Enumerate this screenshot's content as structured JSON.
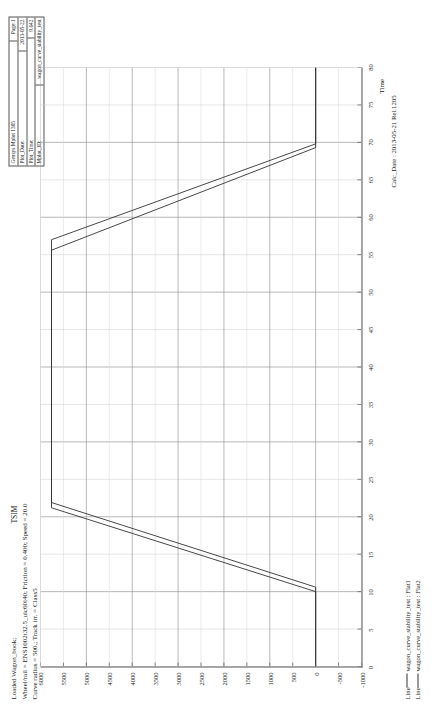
{
  "info_box": {
    "app_title": "Gensys Mplot 1305",
    "page_label": "Page:1",
    "plot_date_label": "Plot_Date:",
    "plot_date_value": "2013-05-22",
    "plot_time_label": "Plot_Time:",
    "plot_time_value": "9.642",
    "mplot_id_label": "Mplot_ID:",
    "mplot_id_value": "wagon_curve_stability_test"
  },
  "title_block": {
    "line1": "Loaded Wagon_book;",
    "line2": "Wheel/rail = ENS1002t32.5_uic60i40; Friction = 0.400; Speed = 20.0",
    "line3": "Curve radius = 500.; Track irr. = Class5",
    "tsim": "TSIM"
  },
  "footer": {
    "calc_date": "Calc_Date : 2013-05-21 Rel.1205",
    "legend": [
      {
        "marker": "Line",
        "dash": "—",
        "text": "wagon_curve_stability_test : Flat1",
        "color": "#333333"
      },
      {
        "marker": "Line",
        "dash": "—",
        "text": "wagon_curve_stability_test : Flat2",
        "color": "#333333"
      }
    ]
  },
  "chart_data": {
    "type": "line",
    "title": "Loaded Wagon_book;",
    "xlabel": "Time",
    "ylabel": "",
    "xlim": [
      0,
      80
    ],
    "ylim": [
      -1000,
      6000
    ],
    "xticks": [
      0,
      5,
      10,
      15,
      20,
      25,
      30,
      35,
      40,
      45,
      50,
      55,
      60,
      65,
      70,
      75,
      80
    ],
    "yticks": [
      -1000,
      -500,
      0,
      500,
      1000,
      1500,
      2000,
      2500,
      3000,
      3500,
      4000,
      4500,
      5000,
      5500,
      6000
    ],
    "xticklabels": [
      "0",
      "5",
      "10",
      "15",
      "20",
      "25",
      "30",
      "35",
      "40",
      "45",
      "50",
      "55",
      "60",
      "65",
      "70",
      "75",
      "80"
    ],
    "yticklabels": [
      "-1000",
      "-500",
      "0",
      "500",
      "1000",
      "1500",
      "2000",
      "2500",
      "3000",
      "3500",
      "4000",
      "4500",
      "5000",
      "5500",
      "6000"
    ],
    "grid": true,
    "legend_position": "below-left",
    "series": [
      {
        "name": "wagon_curve_stability_test : Flat1",
        "color": "#333333",
        "x": [
          0,
          10.0,
          21.2,
          57.0,
          69.8,
          70.0,
          80
        ],
        "y": [
          0,
          0,
          5760,
          5760,
          0,
          0,
          0
        ]
      },
      {
        "name": "wagon_curve_stability_test : Flat2",
        "color": "#333333",
        "x": [
          0,
          10.6,
          21.9,
          55.6,
          69.3,
          70.0,
          80
        ],
        "y": [
          0,
          0,
          5760,
          5760,
          0,
          0,
          0
        ]
      }
    ]
  }
}
